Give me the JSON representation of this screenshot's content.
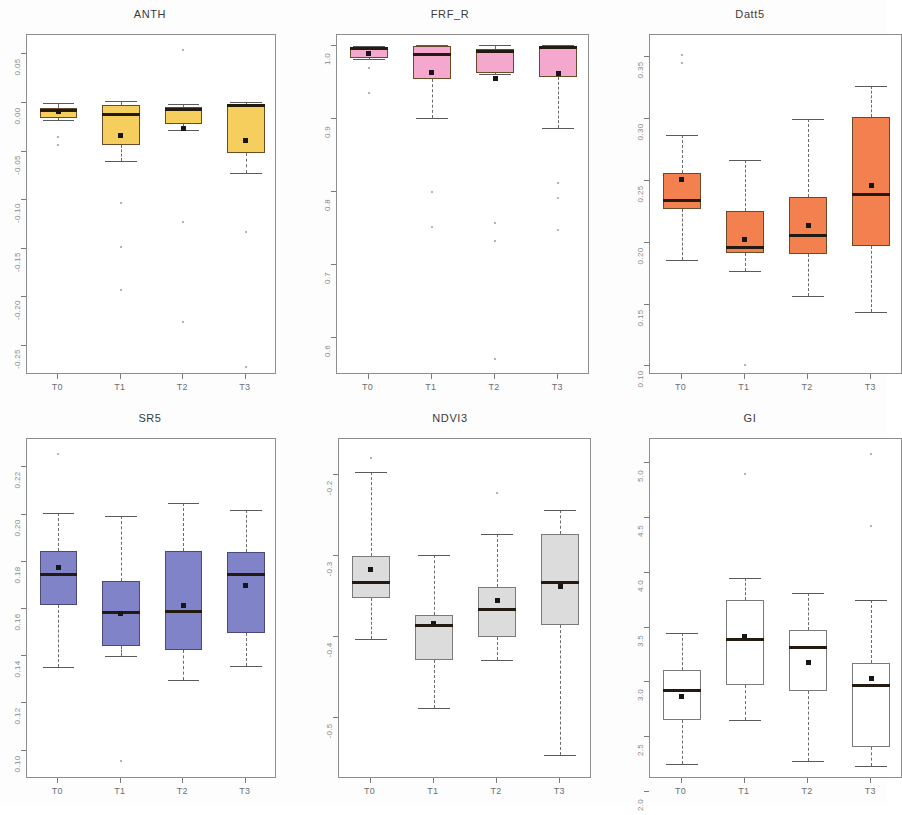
{
  "figure": {
    "width": 887,
    "height": 804,
    "background": "#fdfdfd",
    "layout": "2 rows x 3 columns of boxplot panels",
    "group_labels": [
      "T0",
      "T1",
      "T2",
      "T3"
    ],
    "note_right_panels_cropped": "Datt5 and GI panels are cut off at the right edge of the image"
  },
  "chart_data": [
    {
      "type": "box",
      "title": "ANTH",
      "xlabel": "",
      "ylabel": "",
      "categories": [
        "T0",
        "T1",
        "T2",
        "T3"
      ],
      "ylim": [
        -0.28,
        0.07
      ],
      "yticks": [
        0.05,
        0.0,
        -0.05,
        -0.1,
        -0.15,
        -0.2,
        -0.25
      ],
      "ytick_labels": [
        "0.05",
        "0.00",
        "-0.05",
        "-0.10",
        "-0.15",
        "-0.20",
        "-0.25"
      ],
      "grid": false,
      "fill_color": "#F5CE5E",
      "border_color": "#6a4a28",
      "boxes": [
        {
          "category": "T0",
          "lower_whisker": -0.018,
          "q1": -0.015,
          "median": -0.008,
          "q3": -0.005,
          "upper_whisker": 0.0,
          "mean": -0.009,
          "outliers": [
            -0.035,
            -0.043
          ]
        },
        {
          "category": "T1",
          "lower_whisker": -0.06,
          "q1": -0.043,
          "median": -0.012,
          "q3": -0.002,
          "upper_whisker": 0.002,
          "mean": -0.033,
          "outliers": [
            -0.103,
            -0.148,
            -0.192
          ]
        },
        {
          "category": "T2",
          "lower_whisker": -0.028,
          "q1": -0.022,
          "median": -0.007,
          "q3": -0.004,
          "upper_whisker": -0.001,
          "mean": -0.026,
          "outliers": [
            0.055,
            -0.122,
            -0.225
          ]
        },
        {
          "category": "T3",
          "lower_whisker": -0.072,
          "q1": -0.051,
          "median": -0.003,
          "q3": -0.002,
          "upper_whisker": 0.001,
          "mean": -0.039,
          "outliers": [
            -0.133,
            -0.272
          ]
        }
      ]
    },
    {
      "type": "box",
      "title": "FRF_R",
      "xlabel": "",
      "ylabel": "",
      "categories": [
        "T0",
        "T1",
        "T2",
        "T3"
      ],
      "ylim": [
        0.55,
        1.015
      ],
      "yticks": [
        1.0,
        0.9,
        0.8,
        0.7,
        0.6
      ],
      "ytick_labels": [
        "1.0",
        "0.9",
        "0.8",
        "0.7",
        "0.6"
      ],
      "grid": false,
      "fill_color": "#F4A8CE",
      "border_color": "#6a4a28",
      "boxes": [
        {
          "category": "T0",
          "lower_whisker": 0.982,
          "q1": 0.984,
          "median": 0.996,
          "q3": 0.999,
          "upper_whisker": 1.0,
          "mean": 0.99,
          "outliers": [
            0.97,
            0.935
          ]
        },
        {
          "category": "T1",
          "lower_whisker": 0.902,
          "q1": 0.955,
          "median": 0.988,
          "q3": 1.0,
          "upper_whisker": 1.001,
          "mean": 0.964,
          "outliers": [
            0.8,
            0.752
          ]
        },
        {
          "category": "T2",
          "lower_whisker": 0.962,
          "q1": 0.963,
          "median": 0.992,
          "q3": 0.996,
          "upper_whisker": 1.001,
          "mean": 0.956,
          "outliers": [
            0.758,
            0.733,
            0.572
          ]
        },
        {
          "category": "T3",
          "lower_whisker": 0.888,
          "q1": 0.958,
          "median": 0.998,
          "q3": 1.0,
          "upper_whisker": 1.001,
          "mean": 0.963,
          "outliers": [
            0.812,
            0.792,
            0.748
          ]
        }
      ]
    },
    {
      "type": "box",
      "title": "Datt5",
      "xlabel": "",
      "ylabel": "",
      "categories": [
        "T0",
        "T1",
        "T2",
        "T3"
      ],
      "ylim": [
        0.093,
        0.368
      ],
      "yticks": [
        0.35,
        0.3,
        0.25,
        0.2,
        0.15,
        0.1
      ],
      "ytick_labels": [
        "0.35",
        "0.30",
        "0.25",
        "0.20",
        "0.15",
        "0.10"
      ],
      "grid": false,
      "fill_color": "#F2814F",
      "border_color": "#6a4a28",
      "boxes": [
        {
          "category": "T0",
          "lower_whisker": 0.186,
          "q1": 0.227,
          "median": 0.234,
          "q3": 0.256,
          "upper_whisker": 0.287,
          "mean": 0.251,
          "outliers": [
            0.345,
            0.352
          ]
        },
        {
          "category": "T1",
          "lower_whisker": 0.177,
          "q1": 0.192,
          "median": 0.196,
          "q3": 0.226,
          "upper_whisker": 0.267,
          "mean": 0.203,
          "outliers": [
            0.101
          ]
        },
        {
          "category": "T2",
          "lower_whisker": 0.157,
          "q1": 0.191,
          "median": 0.206,
          "q3": 0.237,
          "upper_whisker": 0.3,
          "mean": 0.214,
          "outliers": []
        },
        {
          "category": "T3",
          "lower_whisker": 0.144,
          "q1": 0.197,
          "median": 0.239,
          "q3": 0.302,
          "upper_whisker": 0.327,
          "mean": 0.246,
          "outliers": []
        }
      ]
    },
    {
      "type": "box",
      "title": "SR5",
      "xlabel": "",
      "ylabel": "",
      "categories": [
        "T0",
        "T1",
        "T2",
        "T3"
      ],
      "ylim": [
        0.088,
        0.232
      ],
      "yticks": [
        0.22,
        0.2,
        0.18,
        0.16,
        0.14,
        0.12,
        0.1
      ],
      "ytick_labels": [
        "0.22",
        "0.20",
        "0.18",
        "0.16",
        "0.14",
        "0.12",
        "0.10"
      ],
      "grid": false,
      "fill_color": "#8083C8",
      "border_color": "#4a4a78",
      "boxes": [
        {
          "category": "T0",
          "lower_whisker": 0.1355,
          "q1": 0.1615,
          "median": 0.1745,
          "q3": 0.1845,
          "upper_whisker": 0.2005,
          "mean": 0.1775,
          "outliers": [
            0.2255
          ]
        },
        {
          "category": "T1",
          "lower_whisker": 0.14,
          "q1": 0.1445,
          "median": 0.1585,
          "q3": 0.172,
          "upper_whisker": 0.1995,
          "mean": 0.158,
          "outliers": [
            0.0955
          ]
        },
        {
          "category": "T2",
          "lower_whisker": 0.13,
          "q1": 0.1425,
          "median": 0.159,
          "q3": 0.1845,
          "upper_whisker": 0.205,
          "mean": 0.1615,
          "outliers": []
        },
        {
          "category": "T3",
          "lower_whisker": 0.136,
          "q1": 0.15,
          "median": 0.1745,
          "q3": 0.184,
          "upper_whisker": 0.202,
          "mean": 0.17,
          "outliers": []
        }
      ]
    },
    {
      "type": "box",
      "title": "NDVI3",
      "xlabel": "",
      "ylabel": "",
      "categories": [
        "T0",
        "T1",
        "T2",
        "T3"
      ],
      "ylim": [
        -0.575,
        -0.155
      ],
      "yticks": [
        -0.2,
        -0.3,
        -0.4,
        -0.5
      ],
      "ytick_labels": [
        "-0.2",
        "-0.3",
        "-0.4",
        "-0.5"
      ],
      "grid": false,
      "fill_color": "#DCDCDC",
      "border_color": "#7a7a7a",
      "boxes": [
        {
          "category": "T0",
          "lower_whisker": -0.402,
          "q1": -0.352,
          "median": -0.332,
          "q3": -0.3,
          "upper_whisker": -0.196,
          "mean": -0.316,
          "outliers": [
            -0.178
          ]
        },
        {
          "category": "T1",
          "lower_whisker": -0.487,
          "q1": -0.428,
          "median": -0.385,
          "q3": -0.373,
          "upper_whisker": -0.298,
          "mean": -0.383,
          "outliers": []
        },
        {
          "category": "T2",
          "lower_whisker": -0.428,
          "q1": -0.4,
          "median": -0.365,
          "q3": -0.338,
          "upper_whisker": -0.272,
          "mean": -0.355,
          "outliers": [
            -0.222
          ]
        },
        {
          "category": "T3",
          "lower_whisker": -0.545,
          "q1": -0.385,
          "median": -0.332,
          "q3": -0.272,
          "upper_whisker": -0.243,
          "mean": -0.337,
          "outliers": []
        }
      ]
    },
    {
      "type": "box",
      "title": "GI",
      "xlabel": "",
      "ylabel": "",
      "categories": [
        "T0",
        "T1",
        "T2",
        "T3"
      ],
      "ylim": [
        2.12,
        5.22
      ],
      "yticks": [
        5.0,
        4.5,
        4.0,
        3.5,
        3.0,
        2.5,
        2.0
      ],
      "ytick_labels": [
        "5.0",
        "4.5",
        "4.0",
        "3.5",
        "3.0",
        "2.5",
        "2.0"
      ],
      "grid": false,
      "fill_color": "#FFFFFF",
      "border_color": "#7a7a7a",
      "boxes": [
        {
          "category": "T0",
          "lower_whisker": 2.26,
          "q1": 2.66,
          "median": 2.93,
          "q3": 3.11,
          "upper_whisker": 3.45,
          "mean": 2.87,
          "outliers": []
        },
        {
          "category": "T1",
          "lower_whisker": 2.66,
          "q1": 2.98,
          "median": 3.39,
          "q3": 3.75,
          "upper_whisker": 3.95,
          "mean": 3.42,
          "outliers": [
            4.9
          ]
        },
        {
          "category": "T2",
          "lower_whisker": 2.28,
          "q1": 2.92,
          "median": 3.32,
          "q3": 3.48,
          "upper_whisker": 3.82,
          "mean": 3.18,
          "outliers": []
        },
        {
          "category": "T3",
          "lower_whisker": 2.24,
          "q1": 2.41,
          "median": 2.97,
          "q3": 3.18,
          "upper_whisker": 3.75,
          "mean": 3.04,
          "outliers": [
            5.08,
            4.43
          ]
        }
      ]
    }
  ]
}
